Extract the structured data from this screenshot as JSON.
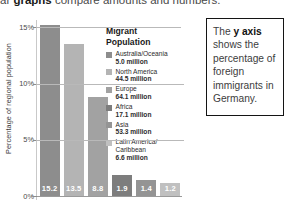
{
  "top_caption": {
    "prefix": "ar ",
    "emphasis": "graphs",
    "suffix": " compare amounts and numbers."
  },
  "callout": {
    "lead": "The ",
    "emphasis": "y axis",
    "rest": " shows the percentage of foreign immigrants in Germany."
  },
  "legend": {
    "title": "Migrant Population",
    "items": [
      {
        "label": "Australia/Oceania",
        "amount": "5.0 million",
        "color": "#8d8d8d"
      },
      {
        "label": "North America",
        "amount": "44.5 million",
        "color": "#b4b4b4"
      },
      {
        "label": "Europe",
        "amount": "64.1 million",
        "color": "#a2a2a2"
      },
      {
        "label": "Africa",
        "amount": "17.1 million",
        "color": "#7d7d7d"
      },
      {
        "label": "Asia",
        "amount": "53.3 million",
        "color": "#949494"
      },
      {
        "label": "Latin America/ Caribbean",
        "amount": "6.6 million",
        "color": "#c0c0c0"
      }
    ]
  },
  "chart_data": {
    "type": "bar",
    "title": "",
    "xlabel": "",
    "ylabel": "Percentage of regional population",
    "ylim": [
      0,
      16
    ],
    "grid": true,
    "legend_position": "right",
    "categories": [
      "Australia/Oceania",
      "North America",
      "Europe",
      "Africa",
      "Asia",
      "Latin America/Caribbean"
    ],
    "values": [
      15.2,
      13.5,
      8.8,
      1.9,
      1.4,
      1.2
    ],
    "value_labels": [
      "15.2",
      "13.5",
      "8.8",
      "1.9",
      "1.4",
      "1.2"
    ],
    "bar_colors": [
      "#8d8d8d",
      "#b4b4b4",
      "#a2a2a2",
      "#7d7d7d",
      "#949494",
      "#c0c0c0"
    ],
    "migrant_population_millions": [
      5.0,
      44.5,
      64.1,
      17.1,
      53.3,
      6.6
    ],
    "ytick_labels": [
      "15%",
      "10%",
      "5%",
      "0%"
    ],
    "ytick_values": [
      15,
      10,
      5,
      0
    ]
  }
}
